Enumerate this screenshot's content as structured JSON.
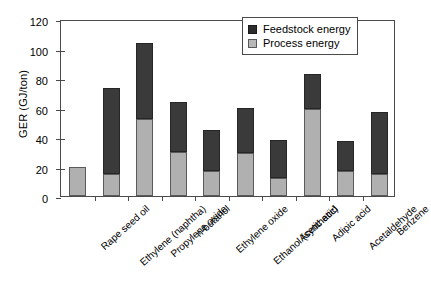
{
  "chart_data": {
    "type": "bar",
    "stacked": true,
    "title": "",
    "xlabel": "",
    "ylabel": "GER (GJ/ton)",
    "ylim": [
      0,
      120
    ],
    "yticks": [
      0,
      20,
      40,
      60,
      80,
      100,
      120
    ],
    "grid": false,
    "legend_position": "top-right",
    "categories": [
      "Rape seed oil",
      "Ethylene (naphtha)",
      "Propylene oxide",
      "n-butanol",
      "Ethylene oxide",
      "Ethanol (synthetic)",
      "Acetic acid",
      "Adipic acid",
      "Acetaldehyde",
      "Benzene"
    ],
    "series": [
      {
        "name": "Process energy",
        "color": "#b0b0b0",
        "values": [
          20,
          15,
          52,
          30,
          17,
          29,
          12,
          59,
          17,
          15
        ]
      },
      {
        "name": "Feedstock energy",
        "color": "#3a3a3a",
        "values": [
          0,
          58,
          52,
          34,
          28,
          31,
          26,
          24,
          20,
          42
        ]
      }
    ],
    "totals": [
      20,
      73,
      104,
      64,
      45,
      60,
      38,
      83,
      37,
      57
    ]
  },
  "legend": {
    "items": [
      {
        "label": "Feedstock energy",
        "swatch": "dark"
      },
      {
        "label": "Process energy",
        "swatch": "light"
      }
    ]
  }
}
